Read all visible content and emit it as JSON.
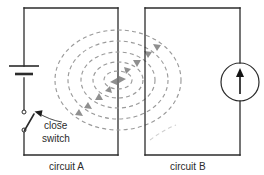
{
  "figure": {
    "circuit_a": {
      "label": "circuit A",
      "components": {
        "battery": "battery-symbol",
        "switch": "open-switch-symbol"
      }
    },
    "circuit_b": {
      "label": "circuit B",
      "components": {
        "meter": "current-meter-symbol"
      }
    },
    "annotation": {
      "line1": "close",
      "line2": "switch"
    },
    "field": {
      "description": "dashed concentric magnetic field loops, clockwise",
      "loop_count": 5,
      "direction": "clockwise"
    },
    "colors": {
      "wire": "#2b2b2b",
      "field_line": "#9a9a9a",
      "field_arrow": "#8f8f8f",
      "text": "#2b2b2b",
      "background": "#ffffff"
    }
  }
}
